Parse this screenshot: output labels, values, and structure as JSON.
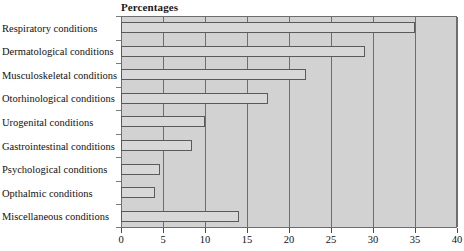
{
  "chart_data": {
    "type": "bar",
    "orientation": "horizontal",
    "title": "Percentages",
    "xlabel": "",
    "ylabel": "",
    "xlim": [
      0,
      40
    ],
    "xticks": [
      0,
      5,
      10,
      15,
      20,
      25,
      30,
      35,
      40
    ],
    "xtick_labels": [
      "0",
      "5",
      "10",
      "15",
      "20",
      "25",
      "30",
      "35",
      "40"
    ],
    "grid": true,
    "legend": null,
    "categories": [
      "Respiratory conditions",
      "Dermatological conditions",
      "Musculoskeletal conditions",
      "Otorhinological conditions",
      "Urogenital conditions",
      "Gastrointestinal conditions",
      "Psychological conditions",
      "Opthalmic conditions",
      "Miscellaneous conditions"
    ],
    "values": [
      35,
      29,
      22,
      17.5,
      10,
      8.5,
      4.6,
      4.1,
      14
    ],
    "colors": {
      "plot_background": "#d2d2d2",
      "bar_fill": "#d8d8d8",
      "bar_border": "#5a5a5a",
      "gridline": "#6e6e6e",
      "text": "#111111"
    }
  }
}
